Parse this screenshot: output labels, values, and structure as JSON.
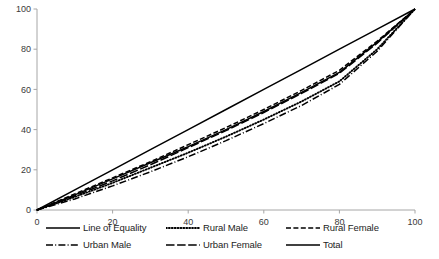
{
  "chart_data": {
    "type": "line",
    "title": "",
    "xlabel": "",
    "ylabel": "",
    "xlim": [
      0,
      100
    ],
    "ylim": [
      0,
      100
    ],
    "xticks": [
      0,
      20,
      40,
      60,
      80,
      100
    ],
    "yticks": [
      0,
      20,
      40,
      60,
      80,
      100
    ],
    "grid": false,
    "legend_position": "bottom",
    "x": [
      0,
      10,
      20,
      30,
      40,
      50,
      60,
      70,
      80,
      90,
      100
    ],
    "series": [
      {
        "name": "Line of Equality",
        "style": "solid",
        "values": [
          0,
          10,
          20,
          30,
          40,
          50,
          60,
          70,
          80,
          90,
          100
        ]
      },
      {
        "name": "Rural Male",
        "style": "dotted",
        "values": [
          0,
          6.5,
          13.5,
          21,
          28.5,
          36.5,
          45,
          54,
          64,
          80,
          100
        ]
      },
      {
        "name": "Rural Female",
        "style": "dashed",
        "values": [
          0,
          8,
          16,
          24,
          32.5,
          41,
          50,
          59.5,
          69.5,
          84,
          100
        ]
      },
      {
        "name": "Urban Male",
        "style": "dash-dot",
        "values": [
          0,
          5.5,
          12,
          19,
          26.5,
          34.5,
          43,
          52,
          62.5,
          79,
          100
        ]
      },
      {
        "name": "Urban Female",
        "style": "long-dash",
        "values": [
          0,
          7,
          14.5,
          22.5,
          31,
          39.5,
          48.5,
          58,
          68,
          83,
          100
        ]
      },
      {
        "name": "Total",
        "style": "solid",
        "values": [
          0,
          7.5,
          15.5,
          23.5,
          31.5,
          40,
          49,
          58.5,
          68.5,
          83.5,
          100
        ]
      }
    ]
  },
  "axis": {
    "x_tick_labels": [
      "0",
      "20",
      "40",
      "60",
      "80",
      "100"
    ],
    "y_tick_labels": [
      "0",
      "20",
      "40",
      "60",
      "80",
      "100"
    ],
    "axis_color": "#a6a6a6"
  },
  "legend": {
    "items": [
      {
        "label": "Line of Equality",
        "style": "solid"
      },
      {
        "label": "Rural Male",
        "style": "dotted"
      },
      {
        "label": "Rural Female",
        "style": "dashed"
      },
      {
        "label": "Urban Male",
        "style": "dash-dot"
      },
      {
        "label": "Urban Female",
        "style": "long-dash"
      },
      {
        "label": "Total",
        "style": "solid"
      }
    ]
  },
  "colors": {
    "line": "#000000",
    "axis": "#a6a6a6",
    "text": "#1d1d1d"
  }
}
